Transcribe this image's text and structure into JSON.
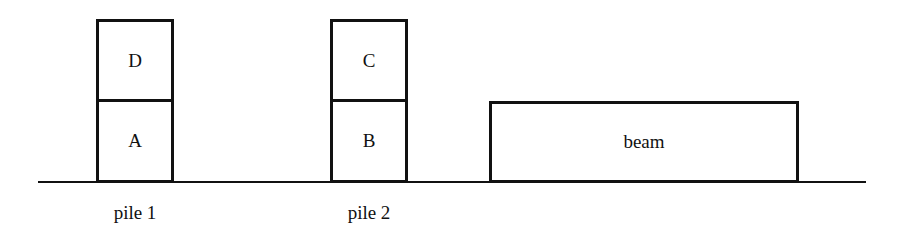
{
  "diagram": {
    "piles": [
      {
        "label": "pile 1",
        "blocks": [
          "D",
          "A"
        ]
      },
      {
        "label": "pile 2",
        "blocks": [
          "C",
          "B"
        ]
      }
    ],
    "beam": {
      "label": "beam"
    }
  }
}
